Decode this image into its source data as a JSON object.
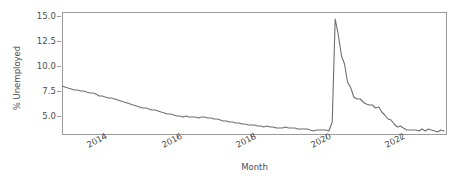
{
  "chart_data": {
    "type": "line",
    "title": "",
    "xlabel": "Month",
    "ylabel": "% Unemployed",
    "grid": false,
    "legend": null,
    "xlim": [
      2012.92,
      2023.25
    ],
    "ylim": [
      3.1,
      15.4
    ],
    "xticks": [
      2014,
      2016,
      2018,
      2020,
      2022
    ],
    "xtick_labels": [
      "2014",
      "2016",
      "2018",
      "2020",
      "2022"
    ],
    "yticks": [
      5.0,
      7.5,
      10.0,
      12.5,
      15.0
    ],
    "ytick_labels": [
      "5.0",
      "7.5",
      "10.0",
      "12.5",
      "15.0"
    ],
    "line_color": "#6e6e6e",
    "series": [
      {
        "name": "% Unemployed",
        "x": [
          2012.92,
          2013.0,
          2013.08,
          2013.17,
          2013.25,
          2013.33,
          2013.42,
          2013.5,
          2013.58,
          2013.67,
          2013.75,
          2013.83,
          2013.92,
          2014.0,
          2014.08,
          2014.17,
          2014.25,
          2014.33,
          2014.42,
          2014.5,
          2014.58,
          2014.67,
          2014.75,
          2014.83,
          2014.92,
          2015.0,
          2015.08,
          2015.17,
          2015.25,
          2015.33,
          2015.42,
          2015.5,
          2015.58,
          2015.67,
          2015.75,
          2015.83,
          2015.92,
          2016.0,
          2016.08,
          2016.17,
          2016.25,
          2016.33,
          2016.42,
          2016.5,
          2016.58,
          2016.67,
          2016.75,
          2016.83,
          2016.92,
          2017.0,
          2017.08,
          2017.17,
          2017.25,
          2017.33,
          2017.42,
          2017.5,
          2017.58,
          2017.67,
          2017.75,
          2017.83,
          2017.92,
          2018.0,
          2018.08,
          2018.17,
          2018.25,
          2018.33,
          2018.42,
          2018.5,
          2018.58,
          2018.67,
          2018.75,
          2018.83,
          2018.92,
          2019.0,
          2019.08,
          2019.17,
          2019.25,
          2019.33,
          2019.42,
          2019.5,
          2019.58,
          2019.67,
          2019.75,
          2019.83,
          2019.92,
          2020.0,
          2020.08,
          2020.17,
          2020.25,
          2020.33,
          2020.42,
          2020.5,
          2020.58,
          2020.67,
          2020.75,
          2020.83,
          2020.92,
          2021.0,
          2021.08,
          2021.17,
          2021.25,
          2021.33,
          2021.42,
          2021.5,
          2021.58,
          2021.67,
          2021.75,
          2021.83,
          2021.92,
          2022.0,
          2022.08,
          2022.17,
          2022.25,
          2022.33,
          2022.42,
          2022.5,
          2022.58,
          2022.67,
          2022.75,
          2022.83,
          2022.92,
          2023.0,
          2023.08,
          2023.17
        ],
        "values": [
          8.0,
          7.9,
          7.8,
          7.7,
          7.6,
          7.6,
          7.5,
          7.5,
          7.4,
          7.3,
          7.3,
          7.2,
          7.0,
          7.0,
          6.9,
          6.8,
          6.8,
          6.7,
          6.6,
          6.5,
          6.4,
          6.3,
          6.2,
          6.1,
          6.0,
          5.9,
          5.8,
          5.8,
          5.7,
          5.6,
          5.6,
          5.5,
          5.4,
          5.3,
          5.2,
          5.2,
          5.1,
          5.0,
          5.0,
          4.9,
          5.0,
          4.9,
          4.9,
          4.9,
          4.8,
          4.9,
          4.9,
          4.8,
          4.8,
          4.7,
          4.7,
          4.6,
          4.5,
          4.5,
          4.4,
          4.4,
          4.3,
          4.3,
          4.2,
          4.2,
          4.1,
          4.1,
          4.1,
          4.0,
          4.0,
          3.9,
          4.0,
          3.9,
          3.9,
          3.8,
          3.8,
          3.8,
          3.9,
          3.8,
          3.8,
          3.8,
          3.7,
          3.7,
          3.7,
          3.7,
          3.6,
          3.5,
          3.6,
          3.6,
          3.6,
          3.6,
          3.5,
          4.4,
          14.7,
          13.2,
          11.0,
          10.2,
          8.4,
          7.8,
          6.9,
          6.7,
          6.7,
          6.4,
          6.2,
          6.1,
          6.1,
          5.8,
          5.9,
          5.4,
          5.1,
          4.7,
          4.6,
          4.2,
          3.9,
          4.0,
          3.8,
          3.6,
          3.6,
          3.6,
          3.6,
          3.5,
          3.7,
          3.5,
          3.7,
          3.6,
          3.5,
          3.4,
          3.6,
          3.5
        ]
      }
    ]
  },
  "axis": {
    "ylabel": "% Unemployed",
    "xlabel": "Month"
  }
}
